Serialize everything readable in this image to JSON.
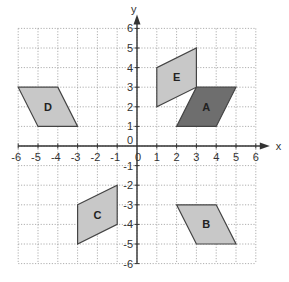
{
  "chart_data": {
    "type": "diagram",
    "title": "",
    "xlabel": "x",
    "ylabel": "y",
    "xlim": [
      -6,
      6
    ],
    "ylim": [
      -6,
      6
    ],
    "grid": true,
    "x_ticks": [
      "-6",
      "-5",
      "-4",
      "-3",
      "-2",
      "-1",
      "0",
      "1",
      "2",
      "3",
      "4",
      "5",
      "6"
    ],
    "y_ticks": [
      "-6",
      "-5",
      "-4",
      "-3",
      "-2",
      "-1",
      "1",
      "2",
      "3",
      "4",
      "5",
      "6"
    ],
    "origin_label": "0",
    "shapes": [
      {
        "label": "A",
        "fill": "#6e6e6e",
        "vertices": [
          [
            2,
            1
          ],
          [
            4,
            1
          ],
          [
            5,
            3
          ],
          [
            3,
            3
          ]
        ],
        "label_pos": [
          3.5,
          2
        ]
      },
      {
        "label": "B",
        "fill": "#c8c8c8",
        "vertices": [
          [
            2,
            -3
          ],
          [
            4,
            -3
          ],
          [
            5,
            -5
          ],
          [
            3,
            -5
          ]
        ],
        "label_pos": [
          3.5,
          -4
        ]
      },
      {
        "label": "C",
        "fill": "#c8c8c8",
        "vertices": [
          [
            -3,
            -3
          ],
          [
            -1,
            -2
          ],
          [
            -1,
            -4
          ],
          [
            -3,
            -5
          ]
        ],
        "label_pos": [
          -2,
          -3.5
        ]
      },
      {
        "label": "D",
        "fill": "#c8c8c8",
        "vertices": [
          [
            -6,
            3
          ],
          [
            -4,
            3
          ],
          [
            -3,
            1
          ],
          [
            -5,
            1
          ]
        ],
        "label_pos": [
          -4.5,
          2
        ]
      },
      {
        "label": "E",
        "fill": "#c8c8c8",
        "vertices": [
          [
            1,
            2
          ],
          [
            1,
            4
          ],
          [
            3,
            5
          ],
          [
            3,
            3
          ]
        ],
        "label_pos": [
          2,
          3.5
        ]
      }
    ]
  },
  "colors": {
    "grid": "#9a9a9a",
    "axis": "#333333",
    "edge": "#444444",
    "text": "#333333"
  }
}
